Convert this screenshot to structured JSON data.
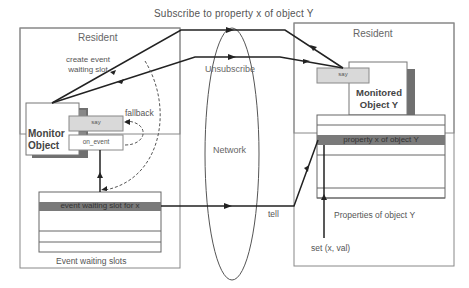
{
  "title": "Subscribe to property x of object Y",
  "left_host": {
    "label": "Resident",
    "create_event_label": "create event\nwaiting slot",
    "monitor_object": "Monitor\nObject",
    "say_method": "say",
    "on_event_method": "on_event",
    "fallback_label": "fallback",
    "event_slots": {
      "highlight_row": "event waiting slot for x",
      "caption": "Event waiting slots"
    }
  },
  "network": {
    "label": "Network",
    "unsubscribe_label": "Unsubscribe"
  },
  "right_host": {
    "label": "Resident",
    "say_method": "say",
    "monitored_object": "Monitored\nObject Y",
    "properties": {
      "highlight_row": "property x of object  Y",
      "caption": "Properties of object Y"
    },
    "set_label": "set (x, val)",
    "tell_label": "tell"
  },
  "colors": {
    "highlight_row": "#7a7a7a",
    "method_box": "#d9d9d9",
    "shadow": "#707070",
    "line": "#333333"
  }
}
